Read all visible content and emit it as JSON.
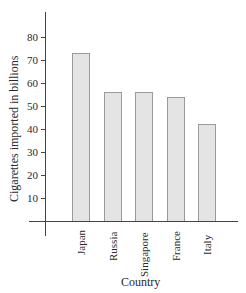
{
  "chart_data": {
    "type": "bar",
    "title": "",
    "xlabel": "Country",
    "ylabel": "Cigarettes imported in billions",
    "categories": [
      "Japan",
      "Russia",
      "Singapore",
      "France",
      "Italy"
    ],
    "values": [
      73,
      56,
      56,
      54,
      42
    ],
    "yticks": [
      10,
      20,
      30,
      40,
      50,
      60,
      70,
      80
    ],
    "ylim": [
      0,
      90
    ],
    "grid": false,
    "legend": null,
    "bar_color": "#e4e4e4",
    "bar_edge_color": "#9a9a9a"
  }
}
